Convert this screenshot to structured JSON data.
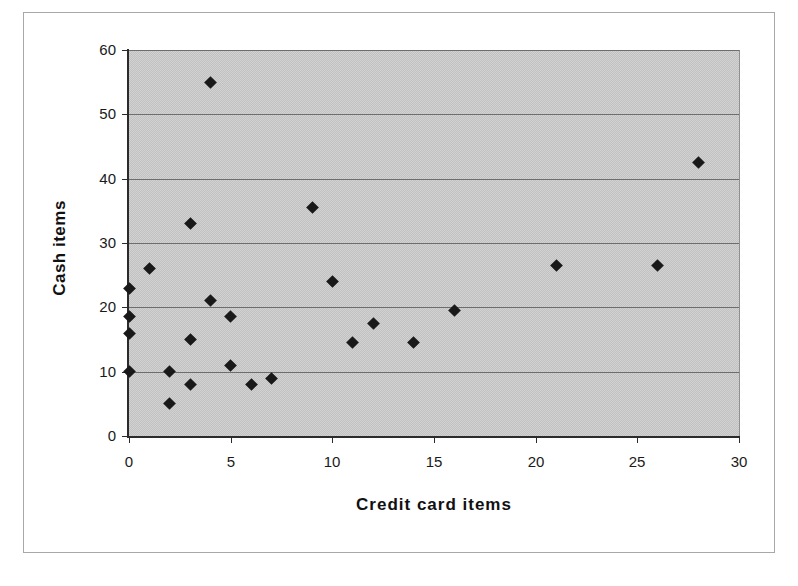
{
  "chart_data": {
    "type": "scatter",
    "title": "",
    "xlabel": "Credit card items",
    "ylabel": "Cash items",
    "xlim": [
      0,
      30
    ],
    "ylim": [
      0,
      60
    ],
    "x_ticks": [
      0,
      5,
      10,
      15,
      20,
      25,
      30
    ],
    "y_ticks": [
      0,
      10,
      20,
      30,
      40,
      50,
      60
    ],
    "grid": "horizontal-only",
    "legend": "none",
    "marker": {
      "shape": "diamond",
      "color": "#191919"
    },
    "plot_area_color": "#cacaca",
    "gridline_color": "#6e6e6e",
    "points": [
      {
        "x": 0,
        "y": 10
      },
      {
        "x": 0,
        "y": 16
      },
      {
        "x": 0,
        "y": 18.5
      },
      {
        "x": 0,
        "y": 23
      },
      {
        "x": 1,
        "y": 26
      },
      {
        "x": 2,
        "y": 5
      },
      {
        "x": 2,
        "y": 10
      },
      {
        "x": 3,
        "y": 8
      },
      {
        "x": 3,
        "y": 15
      },
      {
        "x": 3,
        "y": 33
      },
      {
        "x": 4,
        "y": 21
      },
      {
        "x": 4,
        "y": 55
      },
      {
        "x": 5,
        "y": 11
      },
      {
        "x": 5,
        "y": 18.5
      },
      {
        "x": 6,
        "y": 8
      },
      {
        "x": 7,
        "y": 9
      },
      {
        "x": 9,
        "y": 35.5
      },
      {
        "x": 10,
        "y": 24
      },
      {
        "x": 11,
        "y": 14.5
      },
      {
        "x": 12,
        "y": 17.5
      },
      {
        "x": 14,
        "y": 14.5
      },
      {
        "x": 16,
        "y": 19.5
      },
      {
        "x": 21,
        "y": 26.5
      },
      {
        "x": 26,
        "y": 26.5
      },
      {
        "x": 28,
        "y": 42.5
      }
    ]
  }
}
